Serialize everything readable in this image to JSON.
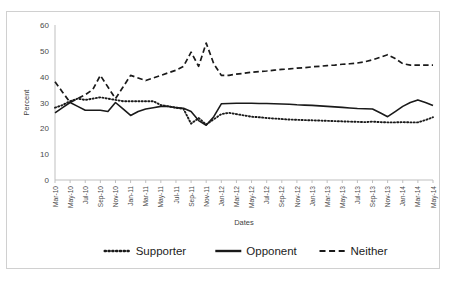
{
  "chart_data": {
    "type": "line",
    "title": "",
    "xlabel": "Dates",
    "ylabel": "Percent",
    "ylim": [
      0,
      60
    ],
    "ytick_step": 10,
    "ytick_labels": [
      "0",
      "10",
      "20",
      "30",
      "40",
      "50",
      "60"
    ],
    "grid": false,
    "legend_position": "bottom",
    "x": [
      "Mar-10",
      "Apr-10",
      "May-10",
      "Jun-10",
      "Jul-10",
      "Aug-10",
      "Sep-10",
      "Oct-10",
      "Nov-10",
      "Dec-10",
      "Jan-11",
      "Feb-11",
      "Mar-11",
      "Apr-11",
      "May-11",
      "Jun-11",
      "Jul-11",
      "Aug-11",
      "Sep-11",
      "Oct-11",
      "Nov-11",
      "Dec-11",
      "Jan-12",
      "Feb-12",
      "Mar-12",
      "Apr-12",
      "May-12",
      "Jun-12",
      "Jul-12",
      "Aug-12",
      "Sep-12",
      "Oct-12",
      "Nov-12",
      "Dec-12",
      "Jan-13",
      "Feb-13",
      "Mar-13",
      "Apr-13",
      "May-13",
      "Jun-13",
      "Jul-13",
      "Aug-13",
      "Sep-13",
      "Oct-13",
      "Nov-13",
      "Dec-13",
      "Jan-14",
      "Feb-14",
      "Mar-14",
      "Apr-14",
      "May-14"
    ],
    "xtick_labels": [
      "Mar-10",
      "May-10",
      "Jul-10",
      "Sep-10",
      "Nov-10",
      "Jan-11",
      "Mar-11",
      "May-11",
      "Jul-11",
      "Sep-11",
      "Nov-11",
      "Jan-12",
      "Mar-12",
      "May-12",
      "Jul-12",
      "Sep-12",
      "Nov-12",
      "Jan-13",
      "Mar-13",
      "May-13",
      "Jul-13",
      "Sep-13",
      "Nov-13",
      "Jan-14",
      "Mar-14",
      "May-14"
    ],
    "series": [
      {
        "name": "Supporter",
        "style": "dotted",
        "color": "#1a1a1a",
        "values": [
          28.0,
          29.0,
          30.5,
          31.5,
          31.0,
          31.5,
          32.0,
          31.5,
          31.0,
          30.5,
          30.5,
          30.5,
          30.5,
          30.5,
          29.0,
          28.5,
          28.0,
          27.5,
          21.8,
          24.0,
          21.5,
          23.5,
          25.5,
          26.0,
          25.5,
          25.0,
          24.5,
          24.3,
          24.0,
          23.8,
          23.6,
          23.4,
          23.3,
          23.2,
          23.1,
          23.0,
          22.9,
          22.8,
          22.7,
          22.6,
          22.5,
          22.4,
          22.6,
          22.4,
          22.3,
          22.3,
          22.4,
          22.3,
          22.3,
          23.2,
          24.3
        ]
      },
      {
        "name": "Opponent",
        "style": "solid",
        "color": "#1a1a1a",
        "values": [
          26.0,
          28.0,
          30.0,
          28.5,
          27.0,
          27.0,
          27.0,
          26.5,
          30.0,
          27.5,
          25.0,
          26.5,
          27.5,
          28.0,
          28.5,
          28.5,
          28.0,
          27.8,
          26.5,
          23.0,
          21.2,
          24.5,
          29.5,
          29.6,
          29.7,
          29.7,
          29.7,
          29.6,
          29.6,
          29.5,
          29.4,
          29.3,
          29.1,
          29.0,
          28.9,
          28.7,
          28.5,
          28.3,
          28.1,
          27.9,
          27.7,
          27.6,
          27.5,
          26.0,
          24.5,
          26.5,
          28.5,
          30.0,
          31.0,
          30.0,
          28.8
        ]
      },
      {
        "name": "Neither",
        "style": "dashed",
        "color": "#1a1a1a",
        "values": [
          38.0,
          34.0,
          30.0,
          31.5,
          33.0,
          35.0,
          40.5,
          36.0,
          31.5,
          36.0,
          40.5,
          39.5,
          38.5,
          39.5,
          40.5,
          41.5,
          42.5,
          44.0,
          49.5,
          44.0,
          53.0,
          45.0,
          40.5,
          40.5,
          41.0,
          41.3,
          41.7,
          42.0,
          42.2,
          42.5,
          42.8,
          43.0,
          43.3,
          43.5,
          43.8,
          44.0,
          44.3,
          44.5,
          44.8,
          45.0,
          45.3,
          45.8,
          46.5,
          47.5,
          48.5,
          47.0,
          45.0,
          44.5,
          44.5,
          44.5,
          44.5
        ]
      }
    ]
  },
  "legend": {
    "items": [
      {
        "label": "Supporter",
        "style": "dotted"
      },
      {
        "label": "Opponent",
        "style": "solid"
      },
      {
        "label": "Neither",
        "style": "dashed"
      }
    ]
  }
}
